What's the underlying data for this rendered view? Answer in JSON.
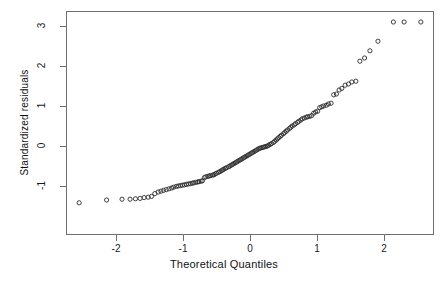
{
  "chart_data": {
    "type": "scatter",
    "title": "",
    "subtitle": "",
    "xlabel": "Theoretical Quantiles",
    "ylabel": "Standardized residuals",
    "grid": false,
    "legend": "none",
    "xlim": [
      -2.75,
      2.75
    ],
    "ylim": [
      -1.6,
      3.3
    ],
    "xticks": [
      -2,
      -1,
      0,
      1,
      2
    ],
    "xticklabels": [
      "-2",
      "-1",
      "0",
      "1",
      "2"
    ],
    "yticks": [
      -1,
      0,
      1,
      2,
      3
    ],
    "yticklabels": [
      "-1",
      "0",
      "1",
      "2",
      "3"
    ],
    "marker": "open-circle",
    "marker_color": "#2b2b2b",
    "point_count": 130,
    "x": [
      -2.55,
      -2.14,
      -1.91,
      -1.79,
      -1.71,
      -1.64,
      -1.58,
      -1.52,
      -1.47,
      -1.42,
      -1.37,
      -1.33,
      -1.29,
      -1.25,
      -1.21,
      -1.17,
      -1.14,
      -1.1,
      -1.07,
      -1.04,
      -1.01,
      -0.98,
      -0.95,
      -0.92,
      -0.89,
      -0.86,
      -0.84,
      -0.81,
      -0.78,
      -0.76,
      -0.73,
      -0.71,
      -0.68,
      -0.66,
      -0.63,
      -0.61,
      -0.59,
      -0.56,
      -0.54,
      -0.52,
      -0.5,
      -0.47,
      -0.45,
      -0.43,
      -0.41,
      -0.39,
      -0.37,
      -0.35,
      -0.32,
      -0.3,
      -0.28,
      -0.26,
      -0.24,
      -0.22,
      -0.2,
      -0.18,
      -0.16,
      -0.14,
      -0.12,
      -0.1,
      -0.08,
      -0.06,
      -0.04,
      -0.02,
      0.0,
      0.02,
      0.04,
      0.06,
      0.08,
      0.1,
      0.12,
      0.14,
      0.16,
      0.18,
      0.2,
      0.22,
      0.24,
      0.26,
      0.28,
      0.3,
      0.32,
      0.35,
      0.37,
      0.39,
      0.41,
      0.43,
      0.45,
      0.47,
      0.5,
      0.52,
      0.54,
      0.56,
      0.59,
      0.61,
      0.63,
      0.66,
      0.68,
      0.71,
      0.73,
      0.76,
      0.78,
      0.81,
      0.84,
      0.86,
      0.89,
      0.92,
      0.95,
      0.98,
      1.01,
      1.04,
      1.07,
      1.1,
      1.14,
      1.17,
      1.21,
      1.25,
      1.29,
      1.33,
      1.37,
      1.42,
      1.47,
      1.52,
      1.58,
      1.64,
      1.71,
      1.79,
      1.91,
      2.14,
      2.3,
      2.55
    ],
    "y": [
      -1.42,
      -1.35,
      -1.33,
      -1.33,
      -1.32,
      -1.31,
      -1.29,
      -1.28,
      -1.26,
      -1.19,
      -1.15,
      -1.13,
      -1.11,
      -1.09,
      -1.07,
      -1.05,
      -1.03,
      -1.01,
      -1.0,
      -0.99,
      -0.98,
      -0.97,
      -0.96,
      -0.95,
      -0.94,
      -0.93,
      -0.92,
      -0.91,
      -0.9,
      -0.89,
      -0.88,
      -0.87,
      -0.79,
      -0.77,
      -0.76,
      -0.75,
      -0.74,
      -0.73,
      -0.72,
      -0.7,
      -0.68,
      -0.66,
      -0.64,
      -0.62,
      -0.6,
      -0.58,
      -0.56,
      -0.54,
      -0.52,
      -0.5,
      -0.48,
      -0.46,
      -0.44,
      -0.42,
      -0.4,
      -0.38,
      -0.36,
      -0.34,
      -0.32,
      -0.3,
      -0.28,
      -0.26,
      -0.24,
      -0.22,
      -0.2,
      -0.18,
      -0.16,
      -0.14,
      -0.12,
      -0.1,
      -0.08,
      -0.06,
      -0.05,
      -0.04,
      -0.03,
      -0.02,
      -0.01,
      0.0,
      0.02,
      0.04,
      0.06,
      0.09,
      0.12,
      0.15,
      0.18,
      0.21,
      0.24,
      0.27,
      0.31,
      0.34,
      0.37,
      0.4,
      0.44,
      0.47,
      0.5,
      0.53,
      0.56,
      0.59,
      0.62,
      0.65,
      0.68,
      0.7,
      0.72,
      0.73,
      0.74,
      0.76,
      0.82,
      0.85,
      0.87,
      0.96,
      0.98,
      1.0,
      1.02,
      1.05,
      1.07,
      1.28,
      1.3,
      1.4,
      1.44,
      1.52,
      1.55,
      1.6,
      1.62,
      2.12,
      2.2,
      2.38,
      2.62,
      3.1,
      3.1,
      3.1
    ]
  },
  "axes": {
    "xlabel": "Theoretical Quantiles",
    "ylabel": "Standardized residuals",
    "x_tick_labels": [
      "-2",
      "-1",
      "0",
      "1",
      "2"
    ],
    "y_tick_labels": [
      "-1",
      "0",
      "1",
      "2",
      "3"
    ]
  },
  "style": {
    "background": "#ffffff",
    "axis_color": "#6e6e6e",
    "marker_color": "#2b2b2b",
    "text_color": "#111111"
  }
}
